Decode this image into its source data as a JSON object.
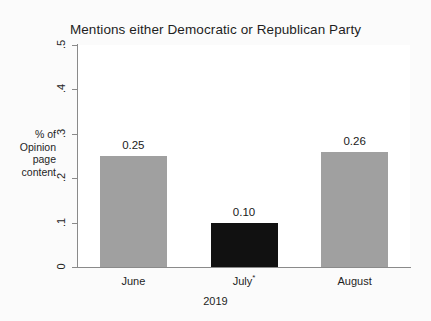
{
  "chart_data": {
    "type": "bar",
    "title": "Mentions either Democratic or Republican Party",
    "xlabel": "2019",
    "ylabel": "% of Opinion page content",
    "ylabel_lines": [
      "% of",
      "Opinion",
      "page",
      "content"
    ],
    "categories": [
      "June",
      "July*",
      "August"
    ],
    "values": [
      0.25,
      0.1,
      0.26
    ],
    "value_labels": [
      "0.25",
      "0.10",
      "0.26"
    ],
    "bar_colors": [
      "#a0a0a0",
      "#111111",
      "#a0a0a0"
    ],
    "ylim": [
      0,
      0.5
    ],
    "ytick_labels": [
      ".5",
      ".4",
      ".3",
      ".2",
      ".1",
      "0"
    ],
    "ytick_values": [
      0.5,
      0.4,
      0.3,
      0.2,
      0.1,
      0
    ],
    "grid": false,
    "legend": "none"
  },
  "axes": {
    "axis_color": "#8a8a8a"
  }
}
